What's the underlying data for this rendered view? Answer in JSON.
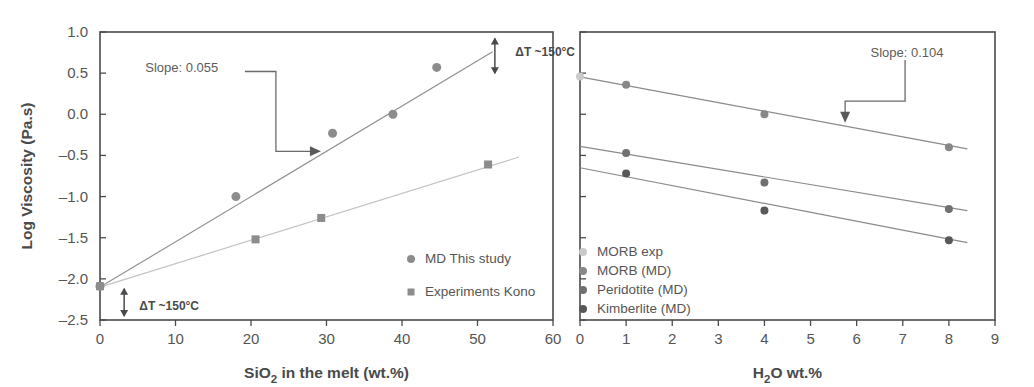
{
  "figure": {
    "background": "#ffffff",
    "width": 1034,
    "height": 387
  },
  "chart_data": [
    {
      "id": "left-panel",
      "type": "scatter",
      "title": "",
      "xlabel": "SiO2 in the melt (wt.%)",
      "xlabel_main": "SiO",
      "xlabel_sub": "2",
      "xlabel_rest": " in the melt (wt.%)",
      "ylabel": "Log Viscosity (Pa.s)",
      "xlim": [
        0,
        60
      ],
      "ylim": [
        -2.5,
        1.0
      ],
      "xticks": [
        0,
        10,
        20,
        30,
        40,
        50,
        60
      ],
      "xticklabels": [
        "0",
        "10",
        "20",
        "30",
        "40",
        "50",
        "60"
      ],
      "yticks": [
        -2.5,
        -2.0,
        -1.5,
        -1.0,
        -0.5,
        0.0,
        0.5,
        1.0
      ],
      "yticklabels": [
        "-2.5",
        "-2.0",
        "-1.5",
        "-1.0",
        "-0.5",
        "0.0",
        "0.5",
        "1.0"
      ],
      "grid": false,
      "legend_position": "lower-right",
      "series": [
        {
          "name": "MD This study",
          "marker": "circle",
          "color": "#8c8c8c",
          "marker_size": 9,
          "x": [
            0.0,
            18.0,
            30.8,
            38.8,
            44.6
          ],
          "y": [
            -2.09,
            -1.0,
            -0.23,
            0.0,
            0.57
          ],
          "trend": {
            "x": [
              0.0,
              52.0
            ],
            "y": [
              -2.1,
              0.76
            ],
            "color": "#909090",
            "slope": 0.055
          }
        },
        {
          "name": "Experiments Kono",
          "marker": "square",
          "color": "#8c8c8c",
          "marker_size": 8,
          "x": [
            0.0,
            20.6,
            29.3,
            51.4
          ],
          "y": [
            -2.09,
            -1.52,
            -1.26,
            -0.61
          ],
          "trend": {
            "x": [
              0.0,
              55.5
            ],
            "y": [
              -2.1,
              -0.52
            ],
            "color": "#c2c2c2",
            "slope": 0.029
          }
        }
      ],
      "annotations": [
        {
          "id": "slope-left",
          "text": "Slope: 0.055",
          "text_x": 6.0,
          "text_y": 0.56,
          "leader": [
            [
              19.2,
              0.52
            ],
            [
              23.3,
              0.52
            ],
            [
              23.3,
              -0.45
            ],
            [
              29.0,
              -0.45
            ]
          ],
          "arrow_at": [
            29.0,
            -0.45
          ],
          "arrow_dir": "right"
        },
        {
          "id": "delta-t-top",
          "text": "ΔT ~150°C",
          "text_x": 55.0,
          "text_y": 0.76,
          "arrow_x": 52.3,
          "arrow_y1": 0.92,
          "arrow_y2": 0.5,
          "style": "double-arrow-vertical"
        },
        {
          "id": "delta-t-bottom",
          "text": "ΔT ~150°C",
          "text_x": 5.2,
          "text_y": -2.33,
          "arrow_x": 3.2,
          "arrow_y1": -2.12,
          "arrow_y2": -2.45,
          "style": "double-arrow-vertical"
        }
      ]
    },
    {
      "id": "right-panel",
      "type": "scatter",
      "title": "",
      "xlabel": "H2O wt.%",
      "xlabel_main": "H",
      "xlabel_sub": "2",
      "xlabel_rest": "O wt.%",
      "ylabel": "",
      "xlim": [
        0,
        9
      ],
      "ylim": [
        -2.5,
        1.0
      ],
      "xticks": [
        0,
        1,
        2,
        3,
        4,
        5,
        6,
        7,
        8,
        9
      ],
      "xticklabels": [
        "0",
        "1",
        "2",
        "3",
        "4",
        "5",
        "6",
        "7",
        "8",
        "9"
      ],
      "yticks": [
        -2.5,
        -2.0,
        -1.5,
        -1.0,
        -0.5,
        0.0,
        0.5,
        1.0
      ],
      "grid": false,
      "legend_position": "lower-left",
      "series": [
        {
          "name": "MORB exp",
          "marker": "circle",
          "color": "#c9c9c9",
          "marker_size": 8,
          "x": [
            0.0
          ],
          "y": [
            0.46
          ],
          "trend": null
        },
        {
          "name": "MORB (MD)",
          "marker": "circle",
          "color": "#888888",
          "marker_size": 8,
          "x": [
            1.0,
            4.0,
            8.0
          ],
          "y": [
            0.36,
            0.0,
            -0.4
          ],
          "trend": {
            "x": [
              0.0,
              8.4
            ],
            "y": [
              0.455,
              -0.42
            ],
            "color": "#8a8a8a",
            "slope": 0.104
          }
        },
        {
          "name": "Peridotite (MD)",
          "marker": "circle",
          "color": "#707070",
          "marker_size": 8,
          "x": [
            1.0,
            4.0,
            8.0
          ],
          "y": [
            -0.47,
            -0.83,
            -1.15
          ],
          "trend": {
            "x": [
              0.0,
              8.4
            ],
            "y": [
              -0.39,
              -1.17
            ],
            "color": "#8a8a8a",
            "slope": 0.093
          }
        },
        {
          "name": "Kimberlite (MD)",
          "marker": "circle",
          "color": "#585858",
          "marker_size": 8,
          "x": [
            1.0,
            4.0,
            8.0
          ],
          "y": [
            -0.72,
            -1.17,
            -1.53
          ],
          "trend": {
            "x": [
              0.0,
              8.4
            ],
            "y": [
              -0.65,
              -1.56
            ],
            "color": "#8a8a8a",
            "slope": 0.108
          }
        }
      ],
      "annotations": [
        {
          "id": "slope-right",
          "text": "Slope: 0.104",
          "text_x": 6.3,
          "text_y": 0.75,
          "leader": [
            [
              7.05,
              0.66
            ],
            [
              7.05,
              0.16
            ],
            [
              5.75,
              0.16
            ],
            [
              5.75,
              -0.08
            ]
          ],
          "arrow_at": [
            5.75,
            -0.08
          ],
          "arrow_dir": "down"
        }
      ]
    }
  ],
  "left_panel": {
    "ylabel": "Log Viscosity (Pa.s)",
    "legend": [
      {
        "label": "MD This study",
        "marker": "circle",
        "color": "#8c8c8c"
      },
      {
        "label": "Experiments Kono",
        "marker": "square",
        "color": "#8c8c8c"
      }
    ]
  },
  "right_panel": {
    "legend": [
      {
        "label": "MORB exp",
        "marker": "circle",
        "color": "#c9c9c9"
      },
      {
        "label": "MORB (MD)",
        "marker": "circle",
        "color": "#888888"
      },
      {
        "label": "Peridotite (MD)",
        "marker": "circle",
        "color": "#707070"
      },
      {
        "label": "Kimberlite (MD)",
        "marker": "circle",
        "color": "#585858"
      }
    ]
  },
  "colors": {
    "axis": "#4a4a4a",
    "tick_text": "#555555",
    "annotation": "#5c5c5c",
    "background": "#ffffff"
  }
}
